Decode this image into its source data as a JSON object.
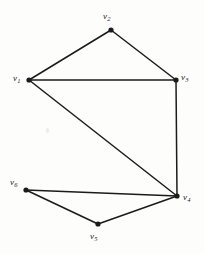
{
  "figure": {
    "type": "undirected-graph-diagram",
    "background_color": "#fdfdfb",
    "ink_color": "#1b1b1b",
    "width": 204,
    "height": 254
  },
  "graph_data": {
    "type": "graph",
    "title": "",
    "directed": false,
    "vertex_count": 6,
    "edge_count": 8,
    "vertices": [
      {
        "id": "v1",
        "symbol": "v",
        "subscript": "1",
        "label": "v1",
        "x": 29,
        "y": 80,
        "label_x": 13,
        "label_y": 74,
        "label_anchor": "left"
      },
      {
        "id": "v2",
        "symbol": "v",
        "subscript": "2",
        "label": "v2",
        "x": 111,
        "y": 30,
        "label_x": 103,
        "label_y": 12,
        "label_anchor": "above"
      },
      {
        "id": "v3",
        "symbol": "v",
        "subscript": "3",
        "label": "v3",
        "x": 176,
        "y": 80,
        "label_x": 181,
        "label_y": 73,
        "label_anchor": "right"
      },
      {
        "id": "v4",
        "symbol": "v",
        "subscript": "4",
        "label": "v4",
        "x": 177,
        "y": 196,
        "label_x": 183,
        "label_y": 193,
        "label_anchor": "right"
      },
      {
        "id": "v5",
        "symbol": "v",
        "subscript": "5",
        "label": "v5",
        "x": 98,
        "y": 224,
        "label_x": 90,
        "label_y": 232,
        "label_anchor": "below"
      },
      {
        "id": "v6",
        "symbol": "v",
        "subscript": "6",
        "label": "v6",
        "x": 26,
        "y": 190,
        "label_x": 10,
        "label_y": 178,
        "label_anchor": "left"
      }
    ],
    "edges": [
      {
        "from": "v1",
        "to": "v2"
      },
      {
        "from": "v2",
        "to": "v3"
      },
      {
        "from": "v1",
        "to": "v3"
      },
      {
        "from": "v1",
        "to": "v4"
      },
      {
        "from": "v3",
        "to": "v4"
      },
      {
        "from": "v4",
        "to": "v5"
      },
      {
        "from": "v5",
        "to": "v6"
      },
      {
        "from": "v6",
        "to": "v4"
      }
    ],
    "vertex_dot_radius": 2.6,
    "edge_stroke_width": 1.5
  }
}
